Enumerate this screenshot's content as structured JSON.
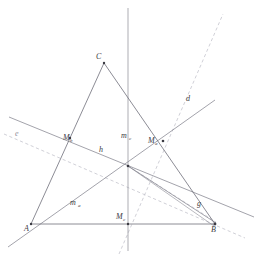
{
  "figure": {
    "background_color": "#ffffff",
    "stroke_color": "#6f6f7a",
    "dashed_color": "#b9b9c2",
    "label_color": "#3a3a42",
    "width": 262,
    "height": 257
  },
  "points": [
    {
      "id": "A",
      "label": "A",
      "sub": "",
      "x": 31,
      "y": 224,
      "label_x": 24,
      "label_y": 231
    },
    {
      "id": "B",
      "label": "B",
      "sub": "",
      "x": 215,
      "y": 224,
      "label_x": 211,
      "label_y": 232
    },
    {
      "id": "C",
      "label": "C",
      "sub": "",
      "x": 104,
      "y": 63,
      "label_x": 96,
      "label_y": 59
    },
    {
      "id": "Ma",
      "label": "M",
      "sub": "a",
      "x": 163,
      "y": 141,
      "label_x": 148,
      "label_y": 143
    },
    {
      "id": "Mb",
      "label": "M",
      "sub": "b",
      "x": 70,
      "y": 138,
      "label_x": 63,
      "label_y": 140
    },
    {
      "id": "Mc",
      "label": "M",
      "sub": "c",
      "x": 128,
      "y": 224,
      "label_x": 116,
      "label_y": 219
    }
  ],
  "line_labels": [
    {
      "id": "d",
      "label": "d",
      "sub": "",
      "x": 186,
      "y": 101,
      "style": "dashed"
    },
    {
      "id": "e",
      "label": "e",
      "sub": "",
      "x": 15,
      "y": 136,
      "style": "faint"
    },
    {
      "id": "g",
      "label": "g",
      "sub": "",
      "x": 197,
      "y": 206,
      "style": "solid"
    },
    {
      "id": "h",
      "label": "h",
      "sub": "",
      "x": 99,
      "y": 152,
      "style": "solid"
    },
    {
      "id": "ma",
      "label": "m",
      "sub": "a",
      "x": 70,
      "y": 205,
      "style": "solid"
    },
    {
      "id": "mc",
      "label": "m",
      "sub": "c",
      "x": 123,
      "y": 138,
      "style": "solid"
    }
  ],
  "segments": [
    {
      "id": "side-AB",
      "from": "A",
      "to": "B",
      "style": "solid"
    },
    {
      "id": "side-AC",
      "from": "A",
      "to": "C",
      "style": "solid"
    },
    {
      "id": "side-CB",
      "from": "C",
      "to": "B",
      "style": "solid"
    }
  ],
  "lines": [
    {
      "id": "median-ma",
      "style": "solid",
      "x1": 8,
      "y1": 247,
      "x2": 213,
      "y2": 101
    },
    {
      "id": "median-mc",
      "style": "solid",
      "x1": 128,
      "y1": 8,
      "x2": 128,
      "y2": 250
    },
    {
      "id": "line-h",
      "style": "solid",
      "x1": 10,
      "y1": 117,
      "x2": 252,
      "y2": 216
    },
    {
      "id": "line-g",
      "style": "solid",
      "x1": 128,
      "y1": 166,
      "x2": 216,
      "y2": 223
    },
    {
      "id": "line-g2",
      "style": "solid",
      "x1": 128,
      "y1": 166,
      "x2": 214,
      "y2": 225
    },
    {
      "id": "line-d-dashed",
      "style": "dashed",
      "x1": 119,
      "y1": 254,
      "x2": 223,
      "y2": 14
    },
    {
      "id": "line-e-dashed",
      "style": "dashed",
      "x1": 4,
      "y1": 134,
      "x2": 245,
      "y2": 238
    },
    {
      "id": "line-aux-dashed",
      "style": "dashed",
      "x1": 128,
      "y1": 166,
      "x2": 214,
      "y2": 225
    }
  ],
  "intersection": {
    "id": "centroid",
    "x": 128,
    "y": 166
  }
}
